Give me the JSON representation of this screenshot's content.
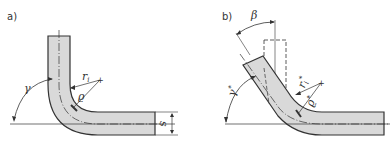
{
  "diagram": {
    "type": "technical-drawing",
    "colors": {
      "fill": "#d9d9d9",
      "stroke": "#333333",
      "background": "#ffffff"
    },
    "panel_a": {
      "label": "a)",
      "angle_label": "γ",
      "radius_label": "r",
      "radius_subscript": "i",
      "rho_label": "ϱ",
      "thickness_label": "s"
    },
    "panel_b": {
      "label": "b)",
      "springback_angle_label": "β",
      "angle_label": "γ*",
      "angle_main": "γ",
      "angle_star": "*",
      "radius_label": "r",
      "radius_subscript": "i",
      "radius_star": "*",
      "rho_label": "ϱ",
      "rho_star": "*"
    }
  }
}
